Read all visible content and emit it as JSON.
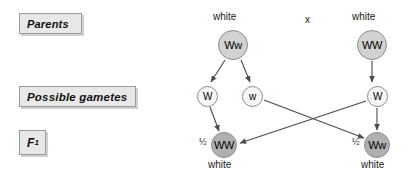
{
  "stage_labels": [
    {
      "id": "parents",
      "text": "Parents"
    },
    {
      "id": "gametes",
      "text": "Possible gametes"
    },
    {
      "id": "f1",
      "text": "F",
      "subscript": "1"
    }
  ],
  "cross_symbol": "x",
  "parents": [
    {
      "id": "parent-left",
      "genotype": "Ww",
      "phenotype": "white",
      "x": 233,
      "y": 45
    },
    {
      "id": "parent-right",
      "genotype": "WW",
      "phenotype": "white",
      "x": 372,
      "y": 45
    }
  ],
  "gametes": [
    {
      "id": "gamete-1",
      "allele": "W",
      "x": 207,
      "y": 96
    },
    {
      "id": "gamete-2",
      "allele": "w",
      "x": 252,
      "y": 96
    },
    {
      "id": "gamete-3",
      "allele": "W",
      "x": 377,
      "y": 96
    }
  ],
  "offspring": [
    {
      "id": "f1-left",
      "genotype": "WW",
      "phenotype": "white",
      "ratio": "½",
      "x": 224,
      "y": 145
    },
    {
      "id": "f1-right",
      "genotype": "Ww",
      "phenotype": "white",
      "ratio": "½",
      "x": 377,
      "y": 145
    }
  ],
  "arrows": [
    {
      "id": "arrow-parent-left-to-gamete-1",
      "from": "parent-left",
      "to": "gamete-1"
    },
    {
      "id": "arrow-parent-left-to-gamete-2",
      "from": "parent-left",
      "to": "gamete-2"
    },
    {
      "id": "arrow-parent-right-to-gamete-3",
      "from": "parent-right",
      "to": "gamete-3"
    },
    {
      "id": "arrow-gamete-1-to-f1-left",
      "from": "gamete-1",
      "to": "f1-left"
    },
    {
      "id": "arrow-gamete-2-to-f1-right",
      "from": "gamete-2",
      "to": "f1-right"
    },
    {
      "id": "arrow-gamete-3-to-f1-left",
      "from": "gamete-3",
      "to": "f1-left"
    },
    {
      "id": "arrow-gamete-3-to-f1-right",
      "from": "gamete-3",
      "to": "f1-right"
    }
  ],
  "colors": {
    "parent_fill": "#d2d2d2",
    "gamete_fill": "#f7f7f7",
    "offspring_fill": "#b0b0b0",
    "stroke": "#8c8c8c",
    "arrow": "#4a4a4a",
    "label_box": "#e8e8e8"
  }
}
